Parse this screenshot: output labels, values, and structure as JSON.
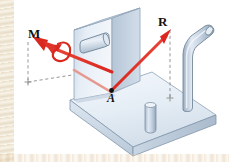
{
  "figure": {
    "domain_kind": "engineering-mechanics-diagram",
    "title_text": "",
    "background_color": "#ffffff",
    "labels": {
      "moment_vector": "M",
      "resultant_vector": "R",
      "point": "A"
    },
    "colors": {
      "vector_red": "#e0342b",
      "vector_red_dark": "#c01f19",
      "vector_red_faded": "#e6978e",
      "body_light": "#e8eef5",
      "body_mid": "#cdd9e6",
      "body_shadow": "#b4c4d6",
      "body_edge": "#7f93a8",
      "peg_light": "#dce5ef",
      "peg_mid": "#b9c8d9",
      "peg_dark": "#93a7bb",
      "dashed_gray": "#8c8c8c",
      "label_black": "#14110f",
      "margin_beige": "#ddc79b"
    },
    "elements": [
      {
        "name": "base-plate",
        "description": "horizontal rectangular plate in isometric view"
      },
      {
        "name": "vertical-plate",
        "description": "upright rectangular plate attached at left rear of base"
      },
      {
        "name": "plate-boss",
        "description": "small horizontal cylindrical boss on the vertical plate face"
      },
      {
        "name": "short-peg",
        "description": "short vertical cylinder standing on the base plate"
      },
      {
        "name": "bent-pipe",
        "description": "tall bent tube rising from the right side of the base plate"
      },
      {
        "name": "vector-M",
        "description": "red double-headed arrow pointing up-left representing a couple moment"
      },
      {
        "name": "moment-curl",
        "description": "red curved arrow coiled about the M vector axis"
      },
      {
        "name": "vector-R",
        "description": "red arrow from point A pointing up-right representing the resultant force"
      },
      {
        "name": "point-A",
        "description": "black dot marking the application point A"
      },
      {
        "name": "dashed-projection-left",
        "description": "gray dashed vertical projection line under the M arrow tail"
      },
      {
        "name": "dashed-projection-right",
        "description": "gray dashed vertical projection line under the R arrow tip"
      },
      {
        "name": "projection-cross-left",
        "description": "small gray cross marking the left projection foot"
      },
      {
        "name": "projection-cross-right",
        "description": "small gray cross marking the right projection foot"
      }
    ]
  }
}
